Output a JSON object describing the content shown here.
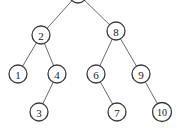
{
  "diagram": {
    "type": "binary-tree",
    "nodes": [
      {
        "id": "root",
        "label": "",
        "x": 78,
        "y": -6
      },
      {
        "id": "n2",
        "label": "2",
        "x": 41,
        "y": 35
      },
      {
        "id": "n8",
        "label": "8",
        "x": 116,
        "y": 31
      },
      {
        "id": "n1",
        "label": "1",
        "x": 18,
        "y": 74
      },
      {
        "id": "n4",
        "label": "4",
        "x": 57,
        "y": 74
      },
      {
        "id": "n6",
        "label": "6",
        "x": 96,
        "y": 74
      },
      {
        "id": "n9",
        "label": "9",
        "x": 141,
        "y": 74
      },
      {
        "id": "n3",
        "label": "3",
        "x": 39,
        "y": 112
      },
      {
        "id": "n7",
        "label": "7",
        "x": 117,
        "y": 112
      },
      {
        "id": "n10",
        "label": "10",
        "x": 162,
        "y": 112
      }
    ],
    "edges": [
      [
        "root",
        "n2"
      ],
      [
        "root",
        "n8"
      ],
      [
        "n2",
        "n1"
      ],
      [
        "n2",
        "n4"
      ],
      [
        "n8",
        "n6"
      ],
      [
        "n8",
        "n9"
      ],
      [
        "n4",
        "n3"
      ],
      [
        "n6",
        "n7"
      ],
      [
        "n9",
        "n10"
      ]
    ],
    "node_radius": 9
  }
}
